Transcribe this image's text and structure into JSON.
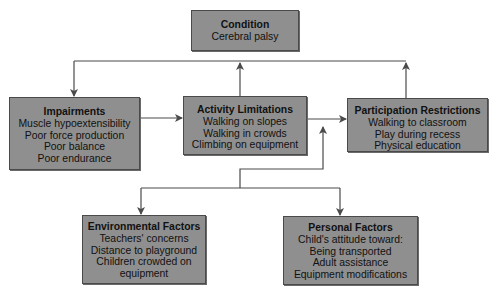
{
  "diagram": {
    "type": "flow-diagram",
    "colors": {
      "box_fill": "#8f8f8f",
      "box_border": "#4a4a4a",
      "line": "#4a4a4a",
      "text": "#111111",
      "background": "#ffffff"
    },
    "nodes": {
      "condition": {
        "title": "Condition",
        "items": [
          "Cerebral palsy"
        ]
      },
      "impairments": {
        "title": "Impairments",
        "items": [
          "Muscle hypoextensibility",
          "Poor force production",
          "Poor balance",
          "Poor endurance"
        ]
      },
      "activity": {
        "title": "Activity Limitations",
        "items": [
          "Walking on slopes",
          "Walking in crowds",
          "Climbing on equipment"
        ]
      },
      "participation": {
        "title": "Participation Restrictions",
        "items": [
          "Walking to classroom",
          "Play during recess",
          "Physical education"
        ]
      },
      "environmental": {
        "title": "Environmental Factors",
        "items": [
          "Teachers' concerns",
          "Distance to playground",
          "Children crowded on",
          "equipment"
        ]
      },
      "personal": {
        "title": "Personal Factors",
        "items": [
          "Child's attitude toward:",
          "Being transported",
          "Adult assistance",
          "Equipment modifications"
        ]
      }
    },
    "edges": [
      {
        "from": "condition",
        "to": "impairments"
      },
      {
        "from": "activity",
        "to": "condition"
      },
      {
        "from": "participation",
        "to": "condition"
      },
      {
        "from": "impairments",
        "to": "activity"
      },
      {
        "from": "activity",
        "to": "participation"
      },
      {
        "from": "contextual-factors",
        "to": "activity-participation-link"
      },
      {
        "from": "contextual-factors",
        "to": "environmental"
      },
      {
        "from": "contextual-factors",
        "to": "personal"
      }
    ]
  }
}
